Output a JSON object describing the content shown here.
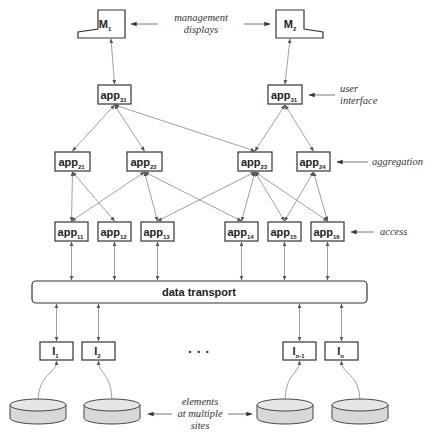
{
  "displays": [
    {
      "id": "M1",
      "base": "M",
      "sub": "1"
    },
    {
      "id": "M2",
      "base": "M",
      "sub": "2"
    }
  ],
  "layers": {
    "user_interface": [
      {
        "id": "app31a",
        "base": "app",
        "sub": "31"
      },
      {
        "id": "app31b",
        "base": "app",
        "sub": "31"
      }
    ],
    "aggregation": [
      {
        "id": "app21",
        "base": "app",
        "sub": "21"
      },
      {
        "id": "app22",
        "base": "app",
        "sub": "22"
      },
      {
        "id": "app23",
        "base": "app",
        "sub": "23"
      },
      {
        "id": "app24",
        "base": "app",
        "sub": "24"
      }
    ],
    "access": [
      {
        "id": "app11",
        "base": "app",
        "sub": "11"
      },
      {
        "id": "app12",
        "base": "app",
        "sub": "12"
      },
      {
        "id": "app13",
        "base": "app",
        "sub": "13"
      },
      {
        "id": "app14",
        "base": "app",
        "sub": "14"
      },
      {
        "id": "app15",
        "base": "app",
        "sub": "15"
      },
      {
        "id": "app16",
        "base": "app",
        "sub": "16"
      }
    ],
    "interfaces": [
      {
        "id": "I1",
        "base": "I",
        "sub": "1"
      },
      {
        "id": "I2",
        "base": "I",
        "sub": "2"
      },
      {
        "id": "In-1",
        "base": "I",
        "sub": "n-1"
      },
      {
        "id": "In",
        "base": "I",
        "sub": "n"
      }
    ]
  },
  "transport_label": "data transport",
  "ellipsis": "· · ·",
  "annotations": {
    "management_displays": [
      "management",
      "displays"
    ],
    "user_interface": [
      "user",
      "interface"
    ],
    "aggregation": "aggregation",
    "access": "access",
    "elements": [
      "elements",
      "at multiple",
      "sites"
    ]
  },
  "connections": [
    [
      "M1",
      "app31a"
    ],
    [
      "M2",
      "app31b"
    ],
    [
      "app31a",
      "app21"
    ],
    [
      "app31a",
      "app22"
    ],
    [
      "app31a",
      "app23"
    ],
    [
      "app31b",
      "app23"
    ],
    [
      "app31b",
      "app24"
    ],
    [
      "app21",
      "app11"
    ],
    [
      "app21",
      "app12"
    ],
    [
      "app22",
      "app11"
    ],
    [
      "app22",
      "app13"
    ],
    [
      "app22",
      "app14"
    ],
    [
      "app23",
      "app13"
    ],
    [
      "app23",
      "app14"
    ],
    [
      "app23",
      "app15"
    ],
    [
      "app23",
      "app16"
    ],
    [
      "app24",
      "app15"
    ],
    [
      "app24",
      "app16"
    ]
  ]
}
